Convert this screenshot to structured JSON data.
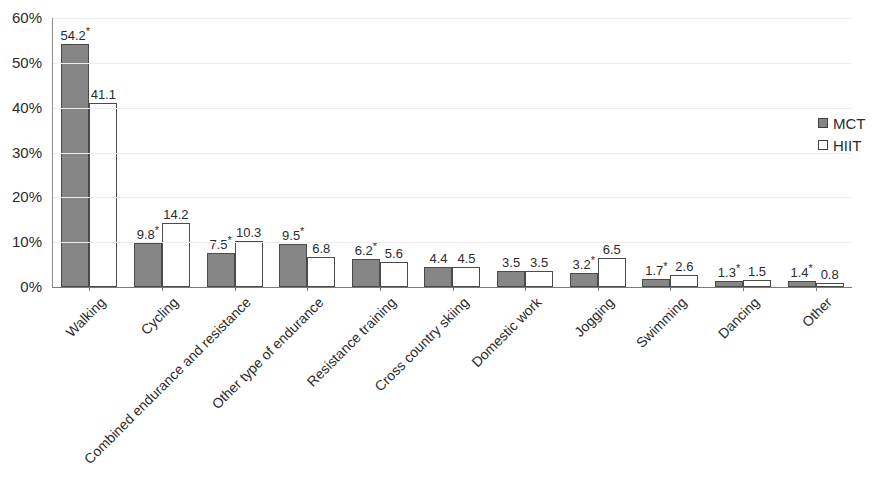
{
  "chart_data": {
    "type": "bar",
    "title": "",
    "subtitle": "",
    "xlabel": "",
    "ylabel": "",
    "ylim": [
      0,
      60
    ],
    "y_tick_labels": [
      "60%",
      "50%",
      "40%",
      "30%",
      "20%",
      "10%",
      "0%"
    ],
    "y_ticks": [
      60,
      50,
      40,
      30,
      20,
      10,
      0
    ],
    "grid": true,
    "legend_position": "right",
    "categories": [
      "Walking",
      "Cycling",
      "Combined endurance and resistance",
      "Other type of endurance",
      "Resistance training",
      "Cross country skiing",
      "Domestic work",
      "Jogging",
      "Swimming",
      "Dancing",
      "Other"
    ],
    "series": [
      {
        "name": "MCT",
        "color": "#868686",
        "values": [
          54.2,
          9.8,
          7.5,
          9.5,
          6.2,
          4.4,
          3.5,
          3.2,
          1.7,
          1.3,
          1.4
        ],
        "labels": [
          "54.2",
          "9.8",
          "7.5",
          "9.5",
          "6.2",
          "4.4",
          "3.5",
          "3.2",
          "1.7",
          "1.3",
          "1.4"
        ],
        "significance": [
          true,
          true,
          true,
          true,
          true,
          false,
          false,
          true,
          true,
          true,
          true
        ]
      },
      {
        "name": "HIIT",
        "color": "#ffffff",
        "values": [
          41.1,
          14.2,
          10.3,
          6.8,
          5.6,
          4.5,
          3.5,
          6.5,
          2.6,
          1.5,
          0.8
        ],
        "labels": [
          "41.1",
          "14.2",
          "10.3",
          "6.8",
          "5.6",
          "4.5",
          "3.5",
          "6.5",
          "2.6",
          "1.5",
          "0.8"
        ],
        "significance": [
          false,
          false,
          false,
          false,
          false,
          false,
          false,
          false,
          false,
          false,
          false
        ]
      }
    ],
    "significance_marker": "*",
    "annotations": []
  },
  "legend": {
    "items": [
      {
        "label": "MCT",
        "marker": "filled-square",
        "color": "#868686"
      },
      {
        "label": "HIIT",
        "marker": "open-square",
        "color": "#ffffff"
      }
    ]
  }
}
